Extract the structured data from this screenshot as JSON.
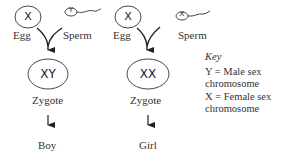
{
  "diagram": {
    "panels": [
      {
        "id": "boy",
        "egg": {
          "chromosome": "X",
          "label": "Egg"
        },
        "sperm": {
          "chromosome": "Y",
          "label": "Sperm"
        },
        "zygote": {
          "chromosomes": "XY",
          "label": "Zygote"
        },
        "outcome": "Boy"
      },
      {
        "id": "girl",
        "egg": {
          "chromosome": "X",
          "label": "Egg"
        },
        "sperm": {
          "chromosome": "X",
          "label": "Sperm"
        },
        "zygote": {
          "chromosomes": "XX",
          "label": "Zygote"
        },
        "outcome": "Girl"
      }
    ],
    "key": {
      "title": "Key",
      "entries": [
        {
          "line1": "Y = Male sex",
          "line2": "chromosome"
        },
        {
          "line1": "X = Female sex",
          "line2": "chromosome"
        }
      ]
    },
    "colors": {
      "ink": "#2a2a2a",
      "background": "#ffffff"
    }
  }
}
